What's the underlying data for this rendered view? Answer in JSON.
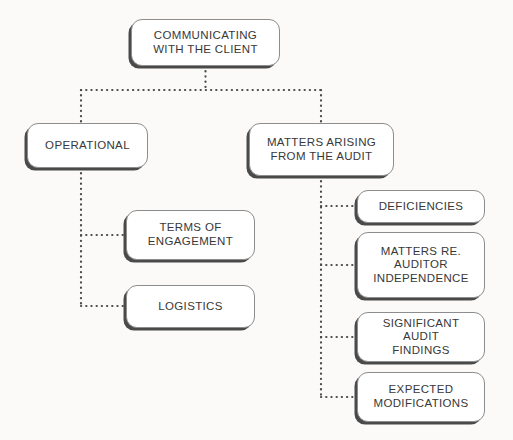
{
  "diagram": {
    "title": "Communicating With The Client",
    "type": "hierarchy-tree",
    "colors": {
      "background": "#fbfaf8",
      "node_fill": "#ffffff",
      "node_border": "#8d8d8d",
      "node_shadow": "#4a4a4a",
      "text": "#383838",
      "connector": "#4a4a4a"
    },
    "connector_style": "dotted"
  },
  "nodes": {
    "root": {
      "id": "communicating-with-the-client",
      "label": "COMMUNICATING\nWITH THE CLIENT",
      "x": 131,
      "y": 19,
      "width": 149,
      "height": 47,
      "level": 0
    },
    "operational": {
      "id": "operational",
      "label": "OPERATIONAL",
      "x": 27,
      "y": 123,
      "width": 121,
      "height": 45,
      "level": 1
    },
    "matters_arising": {
      "id": "matters-arising-from-the-audit",
      "label": "MATTERS ARISING\nFROM THE AUDIT",
      "x": 249,
      "y": 123,
      "width": 145,
      "height": 53,
      "level": 1
    },
    "terms_of_engagement": {
      "id": "terms-of-engagement",
      "label": "TERMS OF\nENGAGEMENT",
      "x": 126,
      "y": 210,
      "width": 129,
      "height": 50,
      "level": 2
    },
    "logistics": {
      "id": "logistics",
      "label": "LOGISTICS",
      "x": 126,
      "y": 285,
      "width": 129,
      "height": 43,
      "level": 2
    },
    "deficiencies": {
      "id": "deficiencies",
      "label": "DEFICIENCIES",
      "x": 357,
      "y": 190,
      "width": 128,
      "height": 33,
      "level": 2
    },
    "matters_re_auditor_independence": {
      "id": "matters-re-auditor-independence",
      "label": "MATTERS RE.\nAUDITOR\nINDEPENDENCE",
      "x": 357,
      "y": 232,
      "width": 128,
      "height": 66,
      "level": 2
    },
    "significant_audit_findings": {
      "id": "significant-audit-findings",
      "label": "SIGNIFICANT AUDIT\nFINDINGS",
      "x": 357,
      "y": 312,
      "width": 128,
      "height": 50,
      "level": 2
    },
    "expected_modifications": {
      "id": "expected-modifications",
      "label": "EXPECTED\nMODIFICATIONS",
      "x": 357,
      "y": 372,
      "width": 128,
      "height": 50,
      "level": 2
    }
  },
  "edges": [
    {
      "from": "communicating-with-the-client",
      "to": "operational"
    },
    {
      "from": "communicating-with-the-client",
      "to": "matters-arising-from-the-audit"
    },
    {
      "from": "operational",
      "to": "terms-of-engagement"
    },
    {
      "from": "operational",
      "to": "logistics"
    },
    {
      "from": "matters-arising-from-the-audit",
      "to": "deficiencies"
    },
    {
      "from": "matters-arising-from-the-audit",
      "to": "matters-re-auditor-independence"
    },
    {
      "from": "matters-arising-from-the-audit",
      "to": "significant-audit-findings"
    },
    {
      "from": "matters-arising-from-the-audit",
      "to": "expected-modifications"
    }
  ]
}
